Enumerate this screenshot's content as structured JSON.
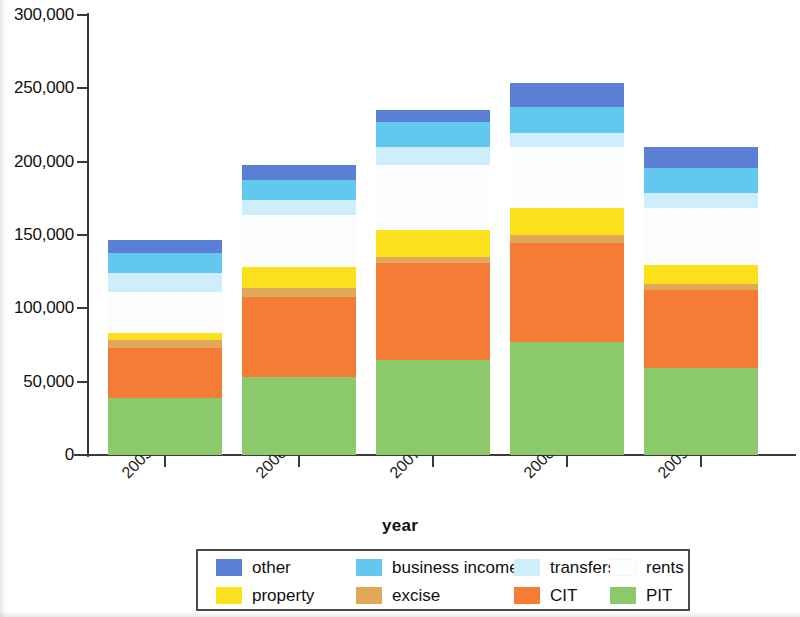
{
  "chart_data": {
    "type": "bar",
    "subtype": "stacked-bar",
    "title": "",
    "xlabel": "year",
    "ylabel": "",
    "categories": [
      "2005",
      "2006",
      "2007",
      "2008",
      "2009"
    ],
    "ylim": [
      0,
      300000
    ],
    "ytick_values": [
      0,
      50000,
      100000,
      150000,
      200000,
      250000,
      300000
    ],
    "ytick_labels": [
      "0",
      "50,000",
      "100,000",
      "150,000",
      "200,000",
      "250,000",
      "300,000"
    ],
    "grid": false,
    "legend_position": "bottom",
    "stack_order_bottom_to_top": [
      "PIT",
      "CIT",
      "excise",
      "property",
      "rents",
      "transfers",
      "business income",
      "other"
    ],
    "series": [
      {
        "name": "PIT",
        "color": "#8cc96a",
        "values": [
          38900,
          53200,
          64800,
          77000,
          59300
        ]
      },
      {
        "name": "CIT",
        "color": "#f47c34",
        "values": [
          34100,
          54500,
          66100,
          67500,
          53200
        ]
      },
      {
        "name": "excise",
        "color": "#e0a95a",
        "values": [
          5500,
          6100,
          4100,
          5500,
          4100
        ]
      },
      {
        "name": "property",
        "color": "#fbe11c",
        "values": [
          4800,
          14300,
          18400,
          18400,
          13000
        ]
      },
      {
        "name": "rents",
        "color": "#fbfdff",
        "values": [
          28000,
          35500,
          44300,
          41600,
          38900
        ]
      },
      {
        "name": "transfers",
        "color": "#cfeefc",
        "values": [
          13000,
          10200,
          12300,
          9500,
          10200
        ]
      },
      {
        "name": "business income",
        "color": "#63c8ef",
        "values": [
          13600,
          13600,
          17000,
          17700,
          17000
        ]
      },
      {
        "name": "other",
        "color": "#5a7fd4",
        "values": [
          8900,
          10200,
          8200,
          16400,
          14300
        ]
      }
    ],
    "totals": [
      146800,
      197600,
      235200,
      253600,
      210000
    ]
  },
  "legend": {
    "row1": [
      {
        "label": "other",
        "color": "#5a7fd4"
      },
      {
        "label": "business income",
        "color": "#63c8ef"
      },
      {
        "label": "transfers",
        "color": "#cfeefc"
      },
      {
        "label": "rents",
        "color": "#fdfeff"
      }
    ],
    "row2": [
      {
        "label": "property",
        "color": "#fbe11c"
      },
      {
        "label": "excise",
        "color": "#e0a95a"
      },
      {
        "label": "CIT",
        "color": "#f47c34"
      },
      {
        "label": "PIT",
        "color": "#8cc96a"
      }
    ]
  }
}
